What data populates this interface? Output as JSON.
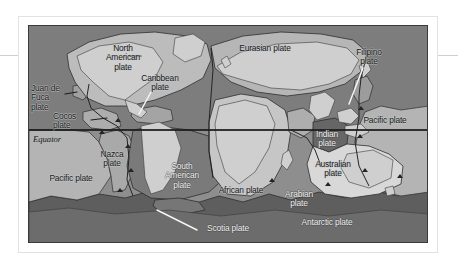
{
  "figure": {
    "kind": "tectonic-plates-world-map",
    "projection_note": "world map, grayscale print figure",
    "colors": {
      "ocean_dark": "#6f6f6f",
      "ocean_mid": "#8e8e8e",
      "plate_light": "#b9b9b9",
      "plate_lighter": "#d2d2d2",
      "plate_highlight": "#f0f0f0",
      "plate_dark": "#5c5c5c",
      "outline": "#2e2e2e",
      "frame": "#3a3a3a",
      "page": "#ffffff",
      "label_dark": "#15181a",
      "label_light": "#f2f2f2"
    }
  },
  "equator": {
    "label": "Equator"
  },
  "plates": [
    {
      "id": "north-american",
      "label": "North\nAmerican\nplate",
      "x": 88,
      "y": 22,
      "tone": "dark",
      "leader": "none"
    },
    {
      "id": "juan-de-fuca",
      "label": "Juan de\nFuca\nplate",
      "x": 4,
      "y": 62,
      "tone": "dark",
      "leader": "dark-right"
    },
    {
      "id": "cocos",
      "label": "Cocos\nplate",
      "x": 36,
      "y": 90,
      "tone": "dark",
      "leader": "dark-right"
    },
    {
      "id": "caribbean",
      "label": "Caribbean\nplate",
      "x": 120,
      "y": 52,
      "tone": "dark",
      "leader": "white-down-left"
    },
    {
      "id": "eurasian",
      "label": "Eurasian plate",
      "x": 235,
      "y": 18,
      "tone": "dark",
      "leader": "none"
    },
    {
      "id": "filipino",
      "label": "Filipino\nplate",
      "x": 333,
      "y": 24,
      "tone": "dark",
      "leader": "white-down-left"
    },
    {
      "id": "pacific-east",
      "label": "Pacific plate",
      "x": 329,
      "y": 95,
      "tone": "dark",
      "leader": "none"
    },
    {
      "id": "pacific-west",
      "label": "Pacific plate",
      "x": 6,
      "y": 152,
      "tone": "dark",
      "leader": "none"
    },
    {
      "id": "nazca",
      "label": "Nazca\nplate",
      "x": 72,
      "y": 130,
      "tone": "dark",
      "leader": "none"
    },
    {
      "id": "south-american",
      "label": "South\nAmerican\nplate",
      "x": 132,
      "y": 140,
      "tone": "light",
      "leader": "none"
    },
    {
      "id": "african",
      "label": "African plate",
      "x": 196,
      "y": 163,
      "tone": "light",
      "leader": "none"
    },
    {
      "id": "arabian",
      "label": "Arabian\nplate",
      "x": 268,
      "y": 168,
      "tone": "light",
      "leader": "none"
    },
    {
      "id": "indian",
      "label": "Indian\nplate",
      "x": 288,
      "y": 112,
      "tone": "light",
      "leader": "none"
    },
    {
      "id": "australian",
      "label": "Australian\nplate",
      "x": 300,
      "y": 140,
      "tone": "dark",
      "leader": "none"
    },
    {
      "id": "antarctic",
      "label": "Antarctic plate",
      "x": 295,
      "y": 196,
      "tone": "light",
      "leader": "none"
    },
    {
      "id": "scotia",
      "label": "Scotia plate",
      "x": 170,
      "y": 202,
      "tone": "light",
      "leader": "white-up-left"
    }
  ]
}
